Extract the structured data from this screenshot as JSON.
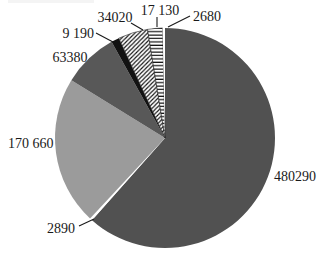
{
  "page": {
    "background": "#ffffff",
    "width": 318,
    "height": 260
  },
  "chart_data": {
    "type": "pie",
    "title": "",
    "direction": "clockwise",
    "start_angle_deg": 0,
    "total": 780240,
    "slices": [
      {
        "label": "480290",
        "value": 480290,
        "fill": "#515151",
        "pattern": null
      },
      {
        "label": "2890",
        "value": 2890,
        "fill": "#ffffff",
        "pattern": null
      },
      {
        "label": "170 660",
        "value": 170660,
        "fill": "#9b9b9b",
        "pattern": null
      },
      {
        "label": "63380",
        "value": 63380,
        "fill": "#585858",
        "pattern": null
      },
      {
        "label": "9 190",
        "value": 9190,
        "fill": "#121212",
        "pattern": null
      },
      {
        "label": "34020",
        "value": 34020,
        "fill": "#ffffff",
        "pattern": "diagonal-hatch"
      },
      {
        "label": "17 130",
        "value": 17130,
        "fill": "#ffffff",
        "pattern": "horizontal-lines"
      },
      {
        "label": "2680",
        "value": 2680,
        "fill": "#ffffff",
        "pattern": null
      }
    ],
    "layout": {
      "cx": 165,
      "cy": 138,
      "r": 110,
      "legend": "none",
      "labels": "outside"
    },
    "annotations": [
      {
        "slice": "480290",
        "text": "480290",
        "x": 274,
        "y": 181,
        "anchor": "start",
        "leader": null
      },
      {
        "slice": "2890",
        "text": "2890",
        "x": 61,
        "y": 233,
        "anchor": "middle",
        "leader": [
          [
            79,
            226
          ],
          [
            94,
            219
          ]
        ]
      },
      {
        "slice": "170 660",
        "text": "170 660",
        "x": 8,
        "y": 148,
        "anchor": "start",
        "leader": null
      },
      {
        "slice": "63380",
        "text": "63380",
        "x": 70,
        "y": 62,
        "anchor": "middle",
        "leader": null
      },
      {
        "slice": "9 190",
        "text": "9 190",
        "x": 94,
        "y": 38,
        "anchor": "end",
        "leader": [
          [
            96,
            33
          ],
          [
            113,
            42
          ]
        ]
      },
      {
        "slice": "34020",
        "text": "34020",
        "x": 115,
        "y": 22,
        "anchor": "middle",
        "leader": [
          [
            131,
            23
          ],
          [
            143,
            30
          ]
        ]
      },
      {
        "slice": "17 130",
        "text": "17 130",
        "x": 160,
        "y": 15,
        "anchor": "middle",
        "leader": [
          [
            157,
            17
          ],
          [
            157,
            27
          ]
        ]
      },
      {
        "slice": "2680",
        "text": "2680",
        "x": 193,
        "y": 21,
        "anchor": "start",
        "leader": [
          [
            190,
            16
          ],
          [
            168,
            27
          ]
        ]
      }
    ],
    "colors": {
      "ink": "#1a1a1a",
      "hatch_line": "#111111",
      "hatch_outline": "#222222",
      "background": "#ffffff"
    }
  }
}
